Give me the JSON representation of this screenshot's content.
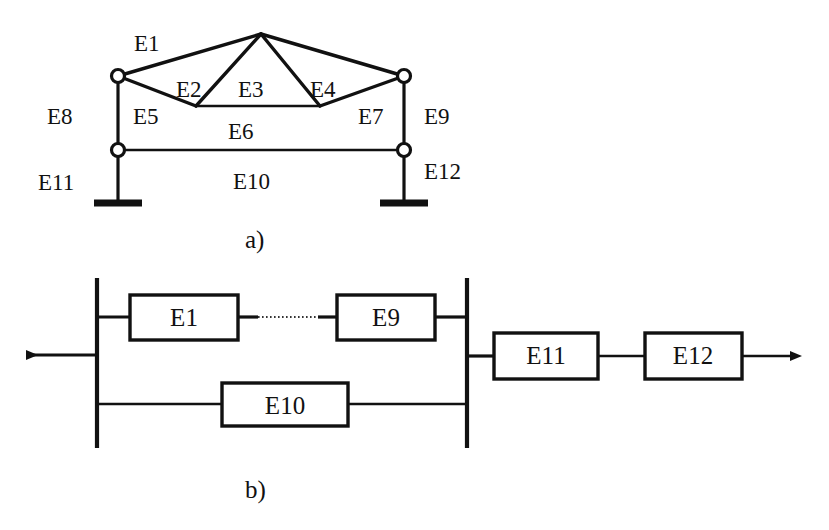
{
  "figure": {
    "panels": [
      {
        "id": "a",
        "caption": "a)",
        "type": "truss-frame-structure",
        "element_labels": [
          "E1",
          "E2",
          "E3",
          "E4",
          "E5",
          "E6",
          "E7",
          "E8",
          "E9",
          "E10",
          "E11",
          "E12"
        ],
        "labels": {
          "e1": "E1",
          "e2": "E2",
          "e3": "E3",
          "e4": "E4",
          "e5": "E5",
          "e6": "E6",
          "e7": "E7",
          "e8": "E8",
          "e9": "E9",
          "e10": "E10",
          "e11": "E11",
          "e12": "E12"
        }
      },
      {
        "id": "b",
        "caption": "b)",
        "type": "reliability-block-diagram",
        "blocks": [
          {
            "id": "b-e1",
            "label": "E1"
          },
          {
            "id": "b-e9",
            "label": "E9"
          },
          {
            "id": "b-e10",
            "label": "E10"
          },
          {
            "id": "b-e11",
            "label": "E11"
          },
          {
            "id": "b-e12",
            "label": "E12"
          }
        ],
        "connections": {
          "e1_to_e9": "dotted",
          "e11_to_e12": "series",
          "left_arrow_direction": "left",
          "right_arrow_direction": "right"
        }
      }
    ],
    "colors": {
      "ink": "#111111",
      "background": "#ffffff",
      "dotted_line": "#333333"
    }
  }
}
